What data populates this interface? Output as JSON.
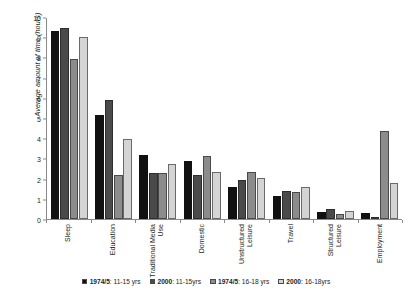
{
  "chart_data": {
    "type": "bar",
    "title": "",
    "xlabel": "",
    "ylabel": "Average amount of time (hours)",
    "ylim": [
      0,
      10
    ],
    "yticks": [
      0,
      1,
      2,
      3,
      4,
      5,
      6,
      7,
      8,
      9,
      10
    ],
    "grid": false,
    "legend_position": "bottom",
    "categories": [
      "Sleep",
      "Education",
      "Traditional Media Use",
      "Domestic",
      "Unstructured Leisure",
      "Travel",
      "Structured Leisure",
      "Employment"
    ],
    "series": [
      {
        "name": "1974/5: 11-15 yrs",
        "name_bold": "1974/5",
        "name_rest": ": 11-15 yrs",
        "color": "#111111",
        "values": [
          9.3,
          5.15,
          3.15,
          2.85,
          1.6,
          1.15,
          0.35,
          0.3
        ]
      },
      {
        "name": "2000: 11-15yrs",
        "name_bold": "2000",
        "name_rest": ": 11-15yrs",
        "color": "#4a4a4a",
        "values": [
          9.45,
          5.9,
          2.3,
          2.2,
          1.95,
          1.4,
          0.5,
          0.05
        ]
      },
      {
        "name": "1974/5: 16-18 yrs",
        "name_bold": "1974/5",
        "name_rest": ": 16-18 yrs",
        "color": "#8c8c8c",
        "values": [
          7.9,
          2.2,
          2.3,
          3.1,
          2.35,
          1.35,
          0.25,
          4.35
        ]
      },
      {
        "name": "2000: 16-18yrs",
        "name_bold": "2000",
        "name_rest": ": 16-18yrs",
        "color": "#d4d4d4",
        "values": [
          9.0,
          3.95,
          2.7,
          2.35,
          2.05,
          1.6,
          0.4,
          1.8
        ]
      }
    ]
  }
}
